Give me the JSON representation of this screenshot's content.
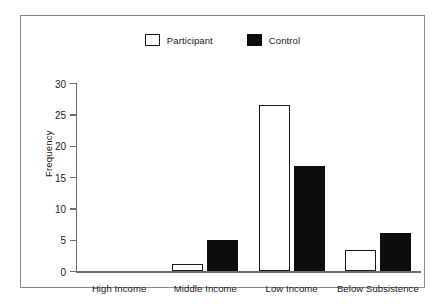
{
  "chart_data": {
    "type": "bar",
    "title": "",
    "xlabel": "",
    "ylabel": "Frequency",
    "categories": [
      "High Income",
      "Middle Income",
      "Low Income",
      "Below Subsistence"
    ],
    "series": [
      {
        "name": "Participant",
        "color": "#ffffff",
        "edge": "#1a1a1a",
        "values": [
          0,
          1.1,
          26.5,
          3.3
        ]
      },
      {
        "name": "Control",
        "color": "#0d0d0d",
        "edge": "#0d0d0d",
        "values": [
          0,
          4.9,
          16.8,
          6.0
        ]
      }
    ],
    "ylim": [
      0,
      30
    ],
    "yticks": [
      0,
      5,
      10,
      15,
      20,
      25,
      30
    ],
    "ytick_labels": [
      "0",
      "5",
      "10",
      "15",
      "20",
      "25",
      "30"
    ],
    "grid": false,
    "legend_position": "top-center"
  },
  "legend": {
    "items": [
      {
        "label": "Participant",
        "swatch": "open-square-swatch"
      },
      {
        "label": "Control",
        "swatch": "filled-square-swatch"
      }
    ]
  },
  "colors": {
    "background": "#ffffff",
    "frame": "#8a8a8a",
    "axis": "#6d6d6d",
    "text": "#1a1a1a",
    "bar_fill": "#0d0d0d"
  }
}
